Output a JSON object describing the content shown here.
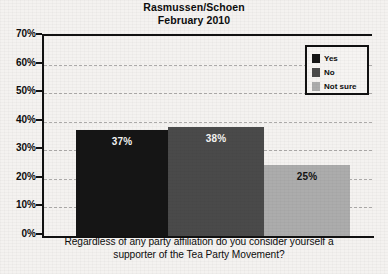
{
  "title": {
    "line1": "Rasmussen/Schoen",
    "line2": "February 2010"
  },
  "legend": {
    "items": [
      {
        "label": "Yes",
        "color": "#151515"
      },
      {
        "label": "No",
        "color": "#4a4a4a"
      },
      {
        "label": "Not sure",
        "color": "#acacac"
      }
    ]
  },
  "axis": {
    "y_ticks": [
      "70%",
      "60%",
      "50%",
      "40%",
      "30%",
      "20%",
      "10%",
      "0%"
    ],
    "caption_line1": "Regardless of any party affiliation do you consider yourself a",
    "caption_line2": "supporter of the Tea Party Movement?"
  },
  "bar_labels": {
    "yes": "37%",
    "no": "38%",
    "not_sure": "25%"
  },
  "chart_data": {
    "type": "bar",
    "title": "Rasmussen/Schoen February 2010",
    "subtitle": "February 2010",
    "xlabel": "Regardless of any party affiliation do you consider yourself a supporter of the Tea Party Movement?",
    "ylabel": "",
    "categories": [
      "Yes",
      "No",
      "Not sure"
    ],
    "values": [
      37,
      38,
      25
    ],
    "data_labels": [
      "37%",
      "38%",
      "25%"
    ],
    "colors": [
      "#151515",
      "#4a4a4a",
      "#acacac"
    ],
    "ylim": [
      0,
      70
    ],
    "ytick_values": [
      0,
      10,
      20,
      30,
      40,
      50,
      60,
      70
    ],
    "ytick_labels": [
      "0%",
      "10%",
      "20%",
      "30%",
      "40%",
      "50%",
      "60%",
      "70%"
    ],
    "grid": true,
    "grid_style": "dashed-horizontal",
    "legend": true,
    "legend_position": "top-right",
    "legend_entries": [
      "Yes",
      "No",
      "Not sure"
    ]
  }
}
